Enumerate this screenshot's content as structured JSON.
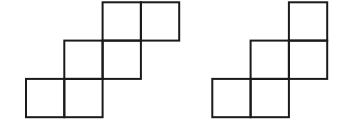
{
  "diagram": {
    "stroke_color": "#1a1a1a",
    "background": "#ffffff",
    "cell_size": 38.3,
    "figures": [
      {
        "name": "left-figure",
        "origin": [
          26,
          2.3
        ],
        "cells": [
          {
            "col": 2,
            "row": 0
          },
          {
            "col": 3,
            "row": 0
          },
          {
            "col": 1,
            "row": 1
          },
          {
            "col": 2,
            "row": 1
          },
          {
            "col": 0,
            "row": 2
          },
          {
            "col": 1,
            "row": 2
          }
        ]
      },
      {
        "name": "right-figure",
        "origin": [
          212.3,
          2.3
        ],
        "cells": [
          {
            "col": 2,
            "row": 0
          },
          {
            "col": 1,
            "row": 1
          },
          {
            "col": 2,
            "row": 1
          },
          {
            "col": 0,
            "row": 2
          },
          {
            "col": 1,
            "row": 2
          }
        ]
      }
    ]
  }
}
